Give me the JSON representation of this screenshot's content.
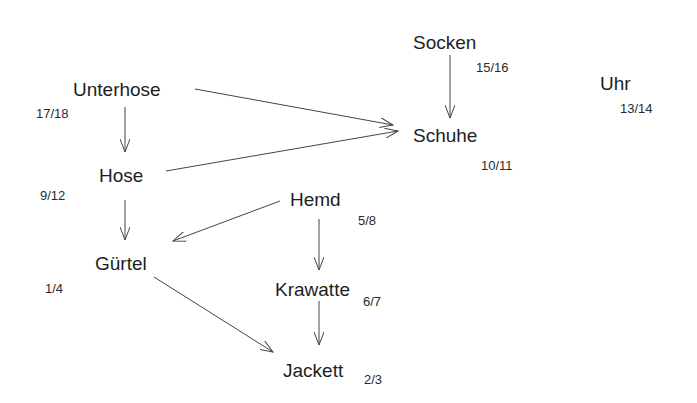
{
  "diagram": {
    "type": "directed-acyclic-graph",
    "nodes": [
      {
        "id": "unterhose",
        "label": "Unterhose",
        "time": "17/18"
      },
      {
        "id": "hose",
        "label": "Hose",
        "time": "9/12"
      },
      {
        "id": "guertel",
        "label": "Gürtel",
        "time": "1/4"
      },
      {
        "id": "hemd",
        "label": "Hemd",
        "time": "5/8"
      },
      {
        "id": "krawatte",
        "label": "Krawatte",
        "time": "6/7"
      },
      {
        "id": "jackett",
        "label": "Jackett",
        "time": "2/3"
      },
      {
        "id": "socken",
        "label": "Socken",
        "time": "15/16"
      },
      {
        "id": "schuhe",
        "label": "Schuhe",
        "time": "10/11"
      },
      {
        "id": "uhr",
        "label": "Uhr",
        "time": "13/14"
      }
    ],
    "edges": [
      {
        "from": "Unterhose",
        "to": "Hose"
      },
      {
        "from": "Unterhose",
        "to": "Schuhe"
      },
      {
        "from": "Hose",
        "to": "Schuhe"
      },
      {
        "from": "Socken",
        "to": "Schuhe"
      },
      {
        "from": "Hose",
        "to": "Gürtel"
      },
      {
        "from": "Hemd",
        "to": "Gürtel"
      },
      {
        "from": "Gürtel",
        "to": "Jackett"
      },
      {
        "from": "Hemd",
        "to": "Krawatte"
      },
      {
        "from": "Krawatte",
        "to": "Jackett"
      }
    ],
    "edge_color": "#444444"
  }
}
